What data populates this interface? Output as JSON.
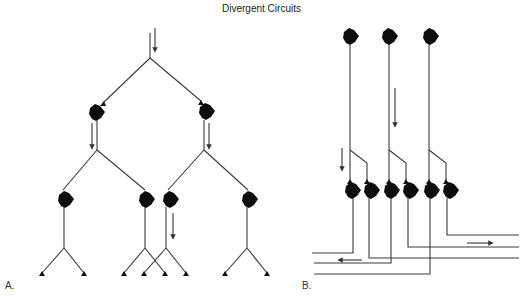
{
  "figure": {
    "title": "Divergent Circuits",
    "panels": [
      {
        "label": "A.",
        "description": "Divergent circuit: single input neuron diverges to two neurons, each diverging to two more neurons, each ending in two axon terminals",
        "levels": [
          {
            "level": 1,
            "neurons": 0,
            "note": "input axon with downward arrow"
          },
          {
            "level": 2,
            "neurons": 2
          },
          {
            "level": 3,
            "neurons": 4
          },
          {
            "level": 4,
            "terminals": 8
          }
        ],
        "arrows": 4
      },
      {
        "label": "B.",
        "description": "Divergent circuit: three top neurons each send axon down, branching to two of six neurons whose axons run horizontally left and right",
        "top_neurons": 3,
        "bottom_neurons": 6,
        "horizontal_fibers": 6,
        "arrows": [
          {
            "direction": "down",
            "count": 2
          },
          {
            "direction": "left",
            "count": 1
          },
          {
            "direction": "right",
            "count": 1
          }
        ]
      }
    ]
  },
  "colors": {
    "background": "#ffffff",
    "line": "#3a3a3a",
    "soma": "#0d0d0d",
    "text": "#222222"
  }
}
